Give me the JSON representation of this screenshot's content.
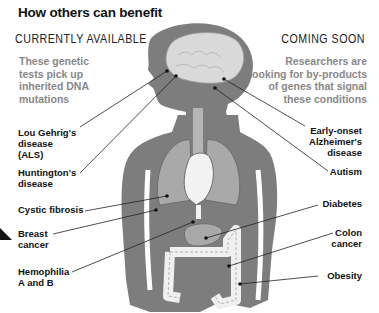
{
  "title": "How others can benefit",
  "left_section": {
    "heading": "CURRENTLY AVAILABLE",
    "description": "These genetic tests pick up inherited DNA mutations",
    "conditions": [
      {
        "label_lines": [
          "Lou Gehrig's",
          "disease",
          "(ALS)"
        ],
        "target": "brain"
      },
      {
        "label_lines": [
          "Huntington's",
          "disease"
        ],
        "target": "brain"
      },
      {
        "label_lines": [
          "Cystic fibrosis"
        ],
        "target": "lungs"
      },
      {
        "label_lines": [
          "Breast",
          "cancer"
        ],
        "target": "breast"
      },
      {
        "label_lines": [
          "Hemophilia",
          "A and B"
        ],
        "target": "blood"
      }
    ]
  },
  "right_section": {
    "heading": "COMING SOON",
    "description": "Researchers are looking for by-products of genes that signal these conditions",
    "conditions": [
      {
        "label_lines": [
          "Early-onset",
          "Alzheimer's",
          "disease"
        ],
        "target": "brain"
      },
      {
        "label_lines": [
          "Autism"
        ],
        "target": "brain"
      },
      {
        "label_lines": [
          "Diabetes"
        ],
        "target": "pancreas"
      },
      {
        "label_lines": [
          "Colon",
          "cancer"
        ],
        "target": "colon"
      },
      {
        "label_lines": [
          "Obesity"
        ],
        "target": "abdomen"
      }
    ]
  },
  "colors": {
    "body": "#7d7d7d",
    "organ_light": "#d9d9d9",
    "organ_mid": "#a9a9a9",
    "description_text": "#888888",
    "label_text": "#111111"
  }
}
